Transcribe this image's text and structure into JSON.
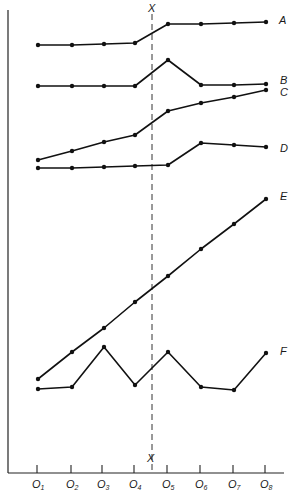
{
  "chart_data": {
    "type": "line",
    "title": "",
    "xlabel": "",
    "ylabel": "",
    "categories": [
      "O1",
      "O2",
      "O3",
      "O4",
      "O5",
      "O6",
      "O7",
      "O8"
    ],
    "category_labels": [
      {
        "main": "O",
        "sub": "1"
      },
      {
        "main": "O",
        "sub": "2"
      },
      {
        "main": "O",
        "sub": "3"
      },
      {
        "main": "O",
        "sub": "4"
      },
      {
        "main": "O",
        "sub": "5"
      },
      {
        "main": "O",
        "sub": "6"
      },
      {
        "main": "O",
        "sub": "7"
      },
      {
        "main": "O",
        "sub": "8"
      }
    ],
    "intervention": {
      "label": "X",
      "position_between": [
        "O4",
        "O5"
      ]
    },
    "y_units": "relative (no scale shown; pixel height above x-axis)",
    "series": [
      {
        "name": "A",
        "values": [
          428,
          428,
          429,
          430,
          449,
          449,
          450,
          451
        ]
      },
      {
        "name": "B",
        "values": [
          387,
          387,
          387,
          387,
          413,
          388,
          388,
          389
        ]
      },
      {
        "name": "C",
        "values": [
          313,
          322,
          331,
          338,
          362,
          370,
          376,
          383
        ]
      },
      {
        "name": "D",
        "values": [
          305,
          305,
          306,
          307,
          308,
          330,
          328,
          326
        ]
      },
      {
        "name": "E",
        "values": [
          94,
          121,
          145,
          171,
          197,
          224,
          249,
          274
        ]
      },
      {
        "name": "F",
        "values": [
          84,
          86,
          126,
          88,
          121,
          86,
          83,
          120
        ]
      }
    ],
    "grid": false,
    "legend_position": "inline labels at right end of each series"
  },
  "labels": {
    "x_top": "X",
    "x_bottom": "X",
    "series_A": "A",
    "series_B": "B",
    "series_C": "C",
    "series_D": "D",
    "series_E": "E",
    "series_F": "F"
  }
}
